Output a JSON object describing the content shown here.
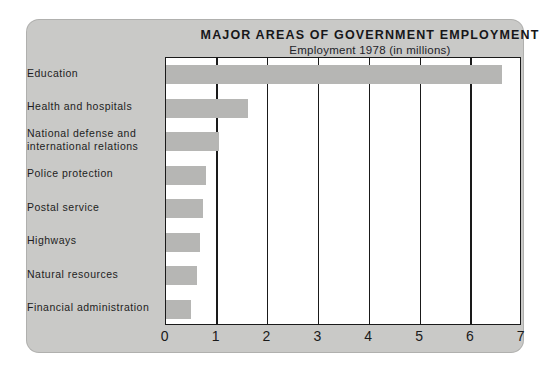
{
  "chart_data": {
    "type": "bar",
    "orientation": "horizontal",
    "title": "MAJOR AREAS OF GOVERNMENT EMPLOYMENT",
    "subtitle": "Employment 1978 (in millions)",
    "xlabel": "",
    "ylabel": "",
    "xlim": [
      0,
      7
    ],
    "xticks": [
      "0",
      "1",
      "2",
      "3",
      "4",
      "5",
      "6",
      "7"
    ],
    "grid": true,
    "legend": false,
    "categories": [
      "Education",
      "Health and hospitals",
      "National defense and\ninternational relations",
      "Police protection",
      "Postal service",
      "Highways",
      "Natural resources",
      "Financial administration"
    ],
    "category_lines": [
      [
        "Education"
      ],
      [
        "Health and hospitals"
      ],
      [
        "National defense and",
        "international  relations"
      ],
      [
        "Police protection"
      ],
      [
        "Postal service"
      ],
      [
        "Highways"
      ],
      [
        "Natural resources"
      ],
      [
        "Financial administration"
      ]
    ],
    "values": [
      6.6,
      1.62,
      1.04,
      0.78,
      0.73,
      0.66,
      0.61,
      0.5
    ],
    "bar_color": "#b6b6b4",
    "plot_background": "#ffffff",
    "panel_background": "#c9c9c7",
    "axis_color": "#1a1a1a"
  }
}
